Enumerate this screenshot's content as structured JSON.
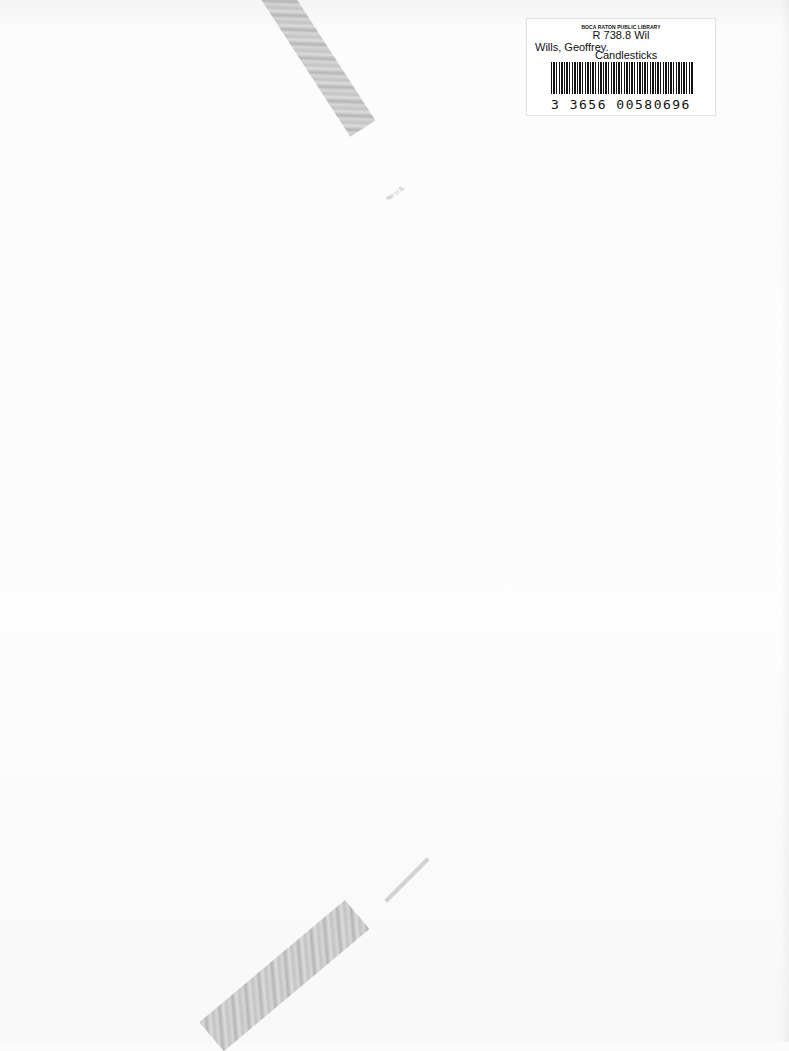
{
  "document": {
    "type": "scanned book inner cover",
    "label": {
      "library_name": "BOCA RATON PUBLIC LIBRARY",
      "call_number": "R 738.8 Wil",
      "author": "Wills, Geoffrey.",
      "title": "Candlesticks",
      "barcode_number": "3 3656 00580696"
    },
    "pencil_mark": "Ne U.S."
  }
}
